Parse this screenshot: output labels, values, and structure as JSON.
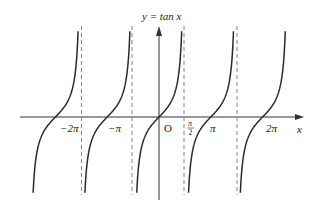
{
  "title": "y = tan x",
  "axes": {
    "x_label": "x",
    "origin_label": "O"
  },
  "ticks": [
    {
      "label": "−2π",
      "x": 68
    },
    {
      "label": "−π",
      "x": 115
    },
    {
      "label": "π",
      "x": 214
    },
    {
      "label": "2π",
      "x": 271
    }
  ],
  "half_pi": {
    "num": "π",
    "den": "2"
  },
  "chart_data": {
    "type": "line",
    "title": "y = tan x",
    "xlabel": "x",
    "ylabel": "y",
    "function": "tan(x)",
    "x_tick_labels": [
      "−2π",
      "−π",
      "O",
      "π/2",
      "π",
      "2π"
    ],
    "zeros": [
      "−2π",
      "−π",
      "0",
      "π",
      "2π"
    ],
    "asymptotes": [
      "−3π/2",
      "−π/2",
      "π/2",
      "3π/2"
    ],
    "asymptote_style": "dashed",
    "branches": 5,
    "grid": false,
    "legend": null
  },
  "colors": {
    "curve": "#2a2a2a",
    "axis": "#333333",
    "asymptote": "#777777"
  }
}
